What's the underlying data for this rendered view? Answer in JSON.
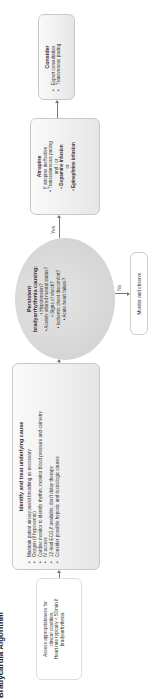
{
  "title": "Bradycardia Algorithm",
  "assess": {
    "lines": [
      "Assess appropriateness for",
      "clinical condition.",
      "Heart rate typically < 50/min if",
      "bradyarrhythmia."
    ]
  },
  "identify": {
    "heading": "Identify and treat underlying cause",
    "items": [
      "Maintain patent airway;assist breathing as necessary",
      "Oxygen (if hypoxemic)",
      "Cardiac monitor to identify rhythm; monitor blood pressure and oximetry",
      "IV access",
      "12-lead ECG,if available; don't delay therapy",
      "Consider possible hypoxic and toxicologic causes"
    ]
  },
  "decision": {
    "heading1": "Persistent",
    "heading2": "bradyarrhythmia causing:",
    "items": [
      "Hypotension?",
      "Acutely altered mental status?",
      "Signs of shock?",
      "Ischemic chest discomfort?",
      "Acute heart failure?"
    ],
    "yes_label": "Yes",
    "no_label": "No"
  },
  "monitor": {
    "label": "Monitor and observe"
  },
  "atropine": {
    "heading": "Atropine",
    "sub": "If atropine ineffective :",
    "item1": "Transcutaneous pacing",
    "andor": "and / or",
    "item2": "Dopamine infusion",
    "or": "or",
    "item3": "Epinephrine infusion"
  },
  "consider": {
    "heading": "Consider",
    "items": [
      "Expert consultation",
      "Transvenous pacing"
    ]
  }
}
